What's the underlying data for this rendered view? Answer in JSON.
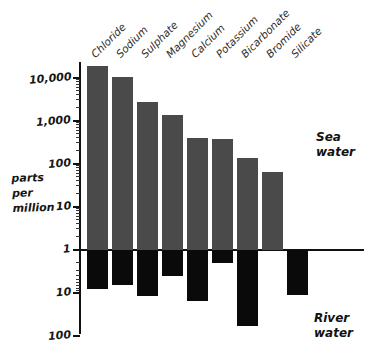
{
  "chart_data": {
    "type": "bar",
    "title": "",
    "subtitle": "",
    "xlabel": "",
    "ylabel": "parts per million",
    "ylabel_lines": [
      "parts",
      "per",
      "million"
    ],
    "scale": "log",
    "orientation": "bidirectional",
    "grid": false,
    "legend_position": "inside-right",
    "categories": [
      "Chloride",
      "Sodium",
      "Sulphate",
      "Magnesium",
      "Calcium",
      "Potassium",
      "Bicarbonate",
      "Bromide",
      "Silicate"
    ],
    "series": [
      {
        "name": "Sea water",
        "direction": "up",
        "color": "#4a4a4a",
        "values": [
          19000,
          10500,
          2700,
          1350,
          400,
          380,
          140,
          65,
          null
        ]
      },
      {
        "name": "River water",
        "direction": "down",
        "color": "#0a0a0a",
        "values": [
          8,
          6.5,
          12,
          4,
          15,
          2,
          58,
          null,
          11
        ]
      }
    ],
    "y_axis_up": {
      "ticks": [
        "1",
        "10",
        "100",
        "1,000",
        "10,000"
      ],
      "values": [
        1,
        10,
        100,
        1000,
        10000
      ],
      "ylim": [
        1,
        30000
      ]
    },
    "y_axis_down": {
      "ticks": [
        "1",
        "10",
        "100"
      ],
      "values": [
        1,
        10,
        100
      ],
      "ylim": [
        1,
        100
      ]
    },
    "annotations": [
      {
        "text_lines": [
          "Sea",
          "water"
        ],
        "target": "upper-series"
      },
      {
        "text_lines": [
          "River",
          "water"
        ],
        "target": "lower-series"
      }
    ]
  },
  "axis": {
    "title_lines": [
      "parts",
      "per",
      "million"
    ],
    "upper_ticks": [
      {
        "label": "10,000",
        "value": 10000
      },
      {
        "label": "1,000",
        "value": 1000
      },
      {
        "label": "100",
        "value": 100
      },
      {
        "label": "10",
        "value": 10
      },
      {
        "label": "1",
        "value": 1
      }
    ],
    "lower_ticks": [
      {
        "label": "10",
        "value": 10
      },
      {
        "label": "100",
        "value": 100
      }
    ]
  },
  "notes": {
    "sea_line1": "Sea",
    "sea_line2": "water",
    "river_line1": "River",
    "river_line2": "water"
  },
  "colors": {
    "sea_bar": "#4a4a4a",
    "river_bar": "#0a0a0a",
    "axis": "#111111",
    "background": "#ffffff"
  }
}
